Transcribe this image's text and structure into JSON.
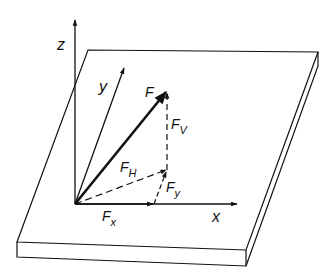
{
  "diagram": {
    "colors": {
      "line": "#111111",
      "background": "#ffffff"
    },
    "axes": {
      "z": {
        "label": "z"
      },
      "y": {
        "label": "y"
      },
      "x": {
        "label": "x"
      }
    },
    "vectors": {
      "F": {
        "label": "F",
        "sub": ""
      },
      "Fv": {
        "label": "F",
        "sub": "V"
      },
      "FH": {
        "label": "F",
        "sub": "H"
      },
      "Fy": {
        "label": "F",
        "sub": "y"
      },
      "Fx": {
        "label": "F",
        "sub": "x"
      }
    }
  }
}
